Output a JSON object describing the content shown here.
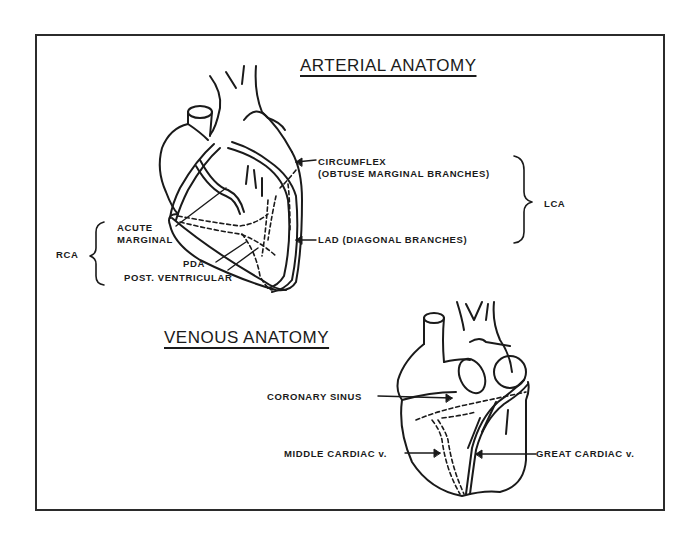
{
  "arterial": {
    "title": "ARTERIAL ANATOMY",
    "labels": {
      "circumflex_line1": "CIRCUMFLEX",
      "circumflex_line2": "(OBTUSE MARGINAL BRANCHES)",
      "lad": "LAD (DIAGONAL BRANCHES)",
      "lca": "LCA",
      "acute_line1": "ACUTE",
      "acute_line2": "MARGINAL",
      "rca": "RCA",
      "pda": "PDA",
      "post_ventricular": "POST. VENTRICULAR"
    }
  },
  "venous": {
    "title": "VENOUS ANATOMY",
    "labels": {
      "coronary_sinus": "CORONARY SINUS",
      "middle_cardiac": "MIDDLE CARDIAC v.",
      "great_cardiac": "GREAT CARDIAC v."
    }
  },
  "colors": {
    "ink": "#1a1a1a",
    "paper": "#ffffff"
  }
}
